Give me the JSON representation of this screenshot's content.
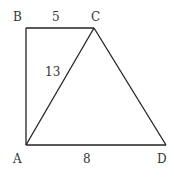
{
  "diagram": {
    "type": "geometry",
    "points": {
      "A": {
        "label": "A",
        "x": 26,
        "y": 145
      },
      "B": {
        "label": "B",
        "x": 26,
        "y": 28
      },
      "C": {
        "label": "C",
        "x": 94,
        "y": 28
      },
      "D": {
        "label": "D",
        "x": 166,
        "y": 145
      }
    },
    "segments": [
      {
        "from": "B",
        "to": "C",
        "label": "5"
      },
      {
        "from": "A",
        "to": "C",
        "label": "13"
      },
      {
        "from": "A",
        "to": "D",
        "label": "8"
      },
      {
        "from": "A",
        "to": "B",
        "label": ""
      },
      {
        "from": "C",
        "to": "D",
        "label": ""
      }
    ],
    "labels": {
      "B": "B",
      "C": "C",
      "A": "A",
      "D": "D",
      "BC": "5",
      "AC": "13",
      "AD": "8"
    },
    "stroke_color": "#222222"
  }
}
